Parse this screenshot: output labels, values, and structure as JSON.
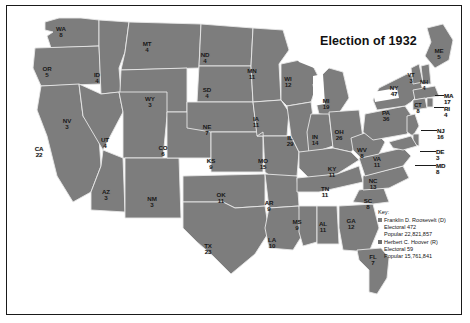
{
  "title": "Election of 1932",
  "colors": {
    "roosevelt_fill": "#7d7d7d",
    "hoover_fill": "#6f6f6f",
    "water": "#ffffff",
    "border": "#1a1a1a",
    "state_line": "#e8e8e8",
    "text": "#171717"
  },
  "key": {
    "heading": "Key:",
    "entries": [
      {
        "candidate": "Franklin D. Roosevelt (D)",
        "electoral": "Electoral 472",
        "popular": "Popular 22,821,857",
        "swatch": "#7d7d7d"
      },
      {
        "candidate": "Herbert C. Hoover (R)",
        "electoral": "Electoral 59",
        "popular": "Popular 15,761,841",
        "swatch": "#6f6f6f"
      }
    ]
  },
  "states": [
    {
      "abbr": "WA",
      "votes": "8",
      "x": 54,
      "y": 20,
      "w": 22
    },
    {
      "abbr": "OR",
      "votes": "5",
      "x": 40,
      "y": 60,
      "w": 22
    },
    {
      "abbr": "CA",
      "votes": "22",
      "x": 32,
      "y": 140,
      "w": 22
    },
    {
      "abbr": "NV",
      "votes": "3",
      "x": 60,
      "y": 112,
      "w": 20
    },
    {
      "abbr": "ID",
      "votes": "4",
      "x": 90,
      "y": 66,
      "w": 20
    },
    {
      "abbr": "MT",
      "votes": "4",
      "x": 140,
      "y": 35,
      "w": 20
    },
    {
      "abbr": "WY",
      "votes": "3",
      "x": 143,
      "y": 90,
      "w": 20
    },
    {
      "abbr": "UT",
      "votes": "4",
      "x": 98,
      "y": 131,
      "w": 20
    },
    {
      "abbr": "AZ",
      "votes": "3",
      "x": 99,
      "y": 183,
      "w": 20
    },
    {
      "abbr": "NM",
      "votes": "3",
      "x": 145,
      "y": 190,
      "w": 20
    },
    {
      "abbr": "CO",
      "votes": "6",
      "x": 156,
      "y": 139,
      "w": 20
    },
    {
      "abbr": "ND",
      "votes": "4",
      "x": 198,
      "y": 46,
      "w": 20
    },
    {
      "abbr": "SD",
      "votes": "4",
      "x": 200,
      "y": 81,
      "w": 20
    },
    {
      "abbr": "NE",
      "votes": "7",
      "x": 200,
      "y": 118,
      "w": 20
    },
    {
      "abbr": "KS",
      "votes": "9",
      "x": 204,
      "y": 152,
      "w": 20
    },
    {
      "abbr": "OK",
      "votes": "11",
      "x": 214,
      "y": 186,
      "w": 20
    },
    {
      "abbr": "TX",
      "votes": "23",
      "x": 201,
      "y": 237,
      "w": 22
    },
    {
      "abbr": "MN",
      "votes": "11",
      "x": 245,
      "y": 62,
      "w": 20
    },
    {
      "abbr": "IA",
      "votes": "11",
      "x": 249,
      "y": 110,
      "w": 20
    },
    {
      "abbr": "MO",
      "votes": "15",
      "x": 256,
      "y": 152,
      "w": 20
    },
    {
      "abbr": "AR",
      "votes": "9",
      "x": 262,
      "y": 194,
      "w": 20
    },
    {
      "abbr": "LA",
      "votes": "10",
      "x": 265,
      "y": 231,
      "w": 20
    },
    {
      "abbr": "MS",
      "votes": "9",
      "x": 290,
      "y": 213,
      "w": 20
    },
    {
      "abbr": "WI",
      "votes": "12",
      "x": 281,
      "y": 70,
      "w": 20
    },
    {
      "abbr": "IL",
      "votes": "29",
      "x": 283,
      "y": 129,
      "w": 20
    },
    {
      "abbr": "MI",
      "votes": "19",
      "x": 319,
      "y": 92,
      "w": 20
    },
    {
      "abbr": "IN",
      "votes": "14",
      "x": 308,
      "y": 128,
      "w": 20
    },
    {
      "abbr": "OH",
      "votes": "26",
      "x": 332,
      "y": 123,
      "w": 20
    },
    {
      "abbr": "KY",
      "votes": "11",
      "x": 325,
      "y": 160,
      "w": 20
    },
    {
      "abbr": "TN",
      "votes": "11",
      "x": 318,
      "y": 180,
      "w": 20
    },
    {
      "abbr": "AL",
      "votes": "11",
      "x": 316,
      "y": 215,
      "w": 20
    },
    {
      "abbr": "GA",
      "votes": "12",
      "x": 344,
      "y": 212,
      "w": 20
    },
    {
      "abbr": "SC",
      "votes": "8",
      "x": 361,
      "y": 192,
      "w": 20
    },
    {
      "abbr": "NC",
      "votes": "13",
      "x": 366,
      "y": 172,
      "w": 20
    },
    {
      "abbr": "VA",
      "votes": "11",
      "x": 370,
      "y": 150,
      "w": 20
    },
    {
      "abbr": "WV",
      "votes": "8",
      "x": 355,
      "y": 141,
      "w": 20
    },
    {
      "abbr": "FL",
      "votes": "7",
      "x": 366,
      "y": 248,
      "w": 20
    },
    {
      "abbr": "PA",
      "votes": "36",
      "x": 379,
      "y": 104,
      "w": 20
    },
    {
      "abbr": "NY",
      "votes": "47",
      "x": 387,
      "y": 79,
      "w": 20
    },
    {
      "abbr": "ME",
      "votes": "5",
      "x": 432,
      "y": 42,
      "w": 20
    },
    {
      "abbr": "VT",
      "votes": "3",
      "x": 404,
      "y": 67,
      "w": 14
    },
    {
      "abbr": "NH",
      "votes": "4",
      "x": 417,
      "y": 74,
      "w": 14
    },
    {
      "abbr": "CT",
      "votes": "8",
      "x": 411,
      "y": 97,
      "w": 14
    }
  ],
  "callouts": [
    {
      "abbr": "MA",
      "votes": "17",
      "x": 437,
      "y": 87
    },
    {
      "abbr": "RI",
      "votes": "4",
      "x": 437,
      "y": 100
    },
    {
      "abbr": "NJ",
      "votes": "16",
      "x": 430,
      "y": 122
    },
    {
      "abbr": "DE",
      "votes": "3",
      "x": 429,
      "y": 143
    },
    {
      "abbr": "MD",
      "votes": "8",
      "x": 429,
      "y": 157
    }
  ]
}
